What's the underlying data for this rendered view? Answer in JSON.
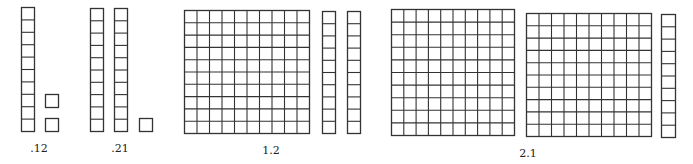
{
  "colors": {
    "line": "#333333",
    "background": "#ffffff"
  },
  "groups": [
    {
      "label": ".12",
      "flats": 0,
      "rods": 1,
      "units": 2
    },
    {
      "label": ".21",
      "flats": 0,
      "rods": 2,
      "units": 1
    },
    {
      "label": "1.2",
      "flats": 1,
      "rods": 2,
      "units": 0
    },
    {
      "label": "2.1",
      "flats": 2,
      "rods": 1,
      "units": 0
    }
  ],
  "shapes": [
    {
      "type": "rod",
      "x": 21,
      "y": 7,
      "w": 13,
      "h": 124
    },
    {
      "type": "unit",
      "x": 45,
      "y": 94,
      "w": 13,
      "h": 13
    },
    {
      "type": "unit",
      "x": 45,
      "y": 118,
      "w": 13,
      "h": 13
    },
    {
      "type": "rod",
      "x": 90,
      "y": 8,
      "w": 13,
      "h": 123
    },
    {
      "type": "rod",
      "x": 114,
      "y": 8,
      "w": 13,
      "h": 123
    },
    {
      "type": "unit",
      "x": 139,
      "y": 118,
      "w": 13,
      "h": 13
    },
    {
      "type": "flat",
      "x": 184,
      "y": 10,
      "w": 125,
      "h": 123
    },
    {
      "type": "rod",
      "x": 322,
      "y": 11,
      "w": 13,
      "h": 122
    },
    {
      "type": "rod",
      "x": 347,
      "y": 11,
      "w": 13,
      "h": 122
    },
    {
      "type": "flat",
      "x": 391,
      "y": 9,
      "w": 123,
      "h": 126
    },
    {
      "type": "flat",
      "x": 526,
      "y": 13,
      "w": 125,
      "h": 123
    },
    {
      "type": "rod",
      "x": 661,
      "y": 14,
      "w": 14,
      "h": 123
    }
  ],
  "labels": [
    {
      "text": ".12",
      "x": 39,
      "y": 142
    },
    {
      "text": ".21",
      "x": 120,
      "y": 142
    },
    {
      "text": "1.2",
      "x": 271,
      "y": 144
    },
    {
      "text": "2.1",
      "x": 528,
      "y": 147
    }
  ]
}
